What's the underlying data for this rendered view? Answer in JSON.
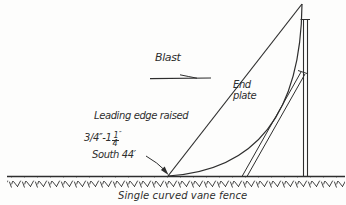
{
  "figure": {
    "caption": "Single curved vane fence"
  },
  "labels": {
    "blast": "Blast",
    "end_plate": "End plate",
    "leading_edge_raised": "Leading edge raised",
    "dimension_prefix": "3/4″-1",
    "dimension_frac_num": "1",
    "dimension_frac_den": "4",
    "dimension_unit": "″",
    "south": "South 44′"
  },
  "icons": {
    "blast_direction_arrow": "right-arrow",
    "south_leader_arrow": "down-right-arrowhead"
  },
  "colors": {
    "ink": "#2e2e2e",
    "background": "#fdfdfc"
  }
}
